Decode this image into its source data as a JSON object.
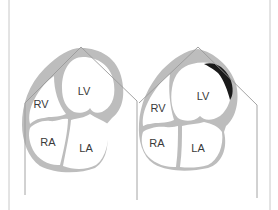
{
  "figure": {
    "colors": {
      "background": "#ffffff",
      "myocardium": "#bdbdbd",
      "chamber_fill": "#ffffff",
      "chamber_outline": "#a8a8a8",
      "sector_line": "#9a9a9a",
      "frame_line": "#c8c8c8",
      "lesion": "#1a1a1a",
      "label_text": "#3a3a3a"
    },
    "panels": [
      {
        "id": "left",
        "labels": {
          "lv": "LV",
          "rv": "RV",
          "ra": "RA",
          "la": "LA"
        },
        "has_dark_segment": false
      },
      {
        "id": "right",
        "labels": {
          "lv": "LV",
          "rv": "RV",
          "ra": "RA",
          "la": "LA"
        },
        "has_dark_segment": true
      }
    ]
  }
}
